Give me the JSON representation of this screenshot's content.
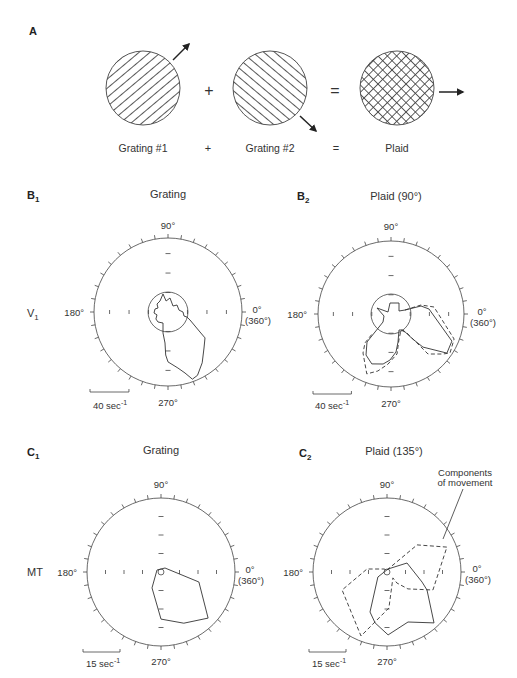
{
  "figure": {
    "panel_a": {
      "label": "A",
      "stimuli": [
        {
          "caption": "Grating #1",
          "pattern": "grating-oblique-rising",
          "motion_arrow": "arrow-up-right"
        },
        {
          "caption": "Grating #2",
          "pattern": "grating-oblique-falling",
          "motion_arrow": "arrow-down-right"
        },
        {
          "caption": "Plaid",
          "pattern": "plaid-crosshatch",
          "motion_arrow": "arrow-right"
        }
      ],
      "operators": {
        "plus": "+",
        "equals": "="
      }
    },
    "row_labels": {
      "v1": {
        "main": "V",
        "sub": "1"
      },
      "mt": "MT"
    }
  },
  "chart_data": [
    {
      "type": "polar",
      "panel": {
        "letter": "B",
        "sub": "1"
      },
      "title": "Grating",
      "angle_labels": {
        "top": "90°",
        "left": "180°",
        "right": "0°",
        "right_alt": "(360°)",
        "bottom": "270°"
      },
      "angle_tick_step_deg": 10,
      "rmax": 76,
      "radial_ticks": [
        20,
        40,
        60
      ],
      "spontaneous_rate": 20.5,
      "scale_bar": {
        "value": 40,
        "label": "40 sec",
        "unit_exp": "-1"
      },
      "series": [
        {
          "style": "solid",
          "closed": true,
          "points": [
            [
              105.5,
              19.2
            ],
            [
              100,
              11.5
            ],
            [
              82,
              14.5
            ],
            [
              50,
              8.0
            ],
            [
              38,
              11.7
            ],
            [
              10,
              11.5
            ],
            [
              0,
              15.4
            ],
            [
              346,
              16.9
            ],
            [
              345,
              20.2
            ],
            [
              340,
              24.0
            ],
            [
              328,
              38.7
            ],
            [
              325,
              46.4
            ],
            [
              315,
              52.3
            ],
            [
              304,
              62.9
            ],
            [
              295,
              71.7
            ],
            [
              290,
              73.4
            ],
            [
              285.6,
              65.0
            ],
            [
              280,
              58.4
            ],
            [
              270,
              51.3
            ],
            [
              267,
              44.2
            ],
            [
              264.5,
              32.0
            ],
            [
              256.6,
              22.2
            ],
            [
              245.6,
              12.4
            ],
            [
              225,
              14.5
            ],
            [
              210,
              14.3
            ],
            [
              195,
              11.7
            ],
            [
              184,
              14.4
            ],
            [
              167,
              13.7
            ],
            [
              158,
              11.1
            ],
            [
              144,
              14.0
            ],
            [
              126,
              14.0
            ]
          ]
        }
      ]
    },
    {
      "type": "polar",
      "panel": {
        "letter": "B",
        "sub": "2"
      },
      "title": "Plaid (90°)",
      "angle_labels": {
        "top": "90°",
        "left": "180°",
        "right": "0°",
        "right_alt": "(360°)",
        "bottom": "270°"
      },
      "angle_tick_step_deg": 10,
      "rmax": 76,
      "radial_ticks": [
        20,
        40,
        60
      ],
      "spontaneous_rate": 20.8,
      "scale_bar": {
        "value": 40,
        "label": "40 sec",
        "unit_exp": "-1"
      },
      "series": [
        {
          "style": "solid",
          "closed": true,
          "points": [
            [
              156.8,
              15.9
            ],
            [
              146,
              3.8
            ],
            [
              95,
              11.5
            ],
            [
              54,
              14.2
            ],
            [
              20.6,
              8.9
            ],
            [
              16,
              15.2
            ],
            [
              15,
              32.3
            ],
            [
              7.5,
              39.9
            ],
            [
              336,
              69.4
            ],
            [
              325,
              71.0
            ],
            [
              314,
              47.9
            ],
            [
              311,
              34.7
            ],
            [
              307,
              20.8
            ],
            [
              296.6,
              18.6
            ],
            [
              284,
              30.1
            ],
            [
              277.5,
              39.9
            ],
            [
              268.8,
              47.9
            ],
            [
              261,
              52.7
            ],
            [
              249,
              55.7
            ],
            [
              238.6,
              50.0
            ],
            [
              229.4,
              38.4
            ],
            [
              228.4,
              25.1
            ],
            [
              225,
              11.8
            ],
            [
              196,
              7.6
            ]
          ]
        },
        {
          "style": "dashed",
          "closed": false,
          "points": [
            [
              16,
              15.2
            ],
            [
              16.7,
              32.6
            ],
            [
              9.2,
              45.4
            ],
            [
              338.4,
              70.6
            ],
            [
              326.5,
              73.6
            ],
            [
              322.4,
              68.3
            ],
            [
              312.8,
              56.7
            ],
            [
              310,
              25.9
            ],
            [
              302,
              19.7
            ],
            [
              287,
              28.3
            ],
            [
              278.5,
              42.1
            ],
            [
              266.6,
              52.2
            ],
            [
              257,
              60.9
            ],
            [
              248,
              67.3
            ],
            [
              234.3,
              50.0
            ],
            [
              228,
              40.5
            ],
            [
              226.5,
              27.3
            ]
          ]
        }
      ]
    },
    {
      "type": "polar",
      "panel": {
        "letter": "C",
        "sub": "1"
      },
      "title": "Grating",
      "angle_labels": {
        "top": "90°",
        "left": "180°",
        "right": "0°",
        "right_alt": "(360°)",
        "bottom": "270°"
      },
      "angle_tick_step_deg": 10,
      "rmax": 30,
      "radial_ticks": [
        7.5,
        15,
        22.5
      ],
      "spontaneous_rate": 1.2,
      "scale_bar": {
        "value": 15,
        "label": "15 sec",
        "unit_exp": "-1"
      },
      "series": [
        {
          "style": "solid",
          "closed": true,
          "points": [
            [
              45,
              2.3
            ],
            [
              345.3,
              15.9
            ],
            [
              315.6,
              26.7
            ],
            [
              294,
              22.7
            ],
            [
              270,
              19.1
            ],
            [
              240.6,
              7.4
            ],
            [
              153,
              1.8
            ]
          ]
        }
      ]
    },
    {
      "type": "polar",
      "panel": {
        "letter": "C",
        "sub": "2"
      },
      "title": "Plaid (135°)",
      "angle_labels": {
        "top": "90°",
        "left": "180°",
        "right": "0°",
        "right_alt": "(360°)",
        "bottom": "270°"
      },
      "angle_tick_step_deg": 10,
      "rmax": 30,
      "radial_ticks": [
        7.5,
        15,
        22.5
      ],
      "spontaneous_rate": 1.2,
      "scale_bar": {
        "value": 15,
        "label": "15 sec",
        "unit_exp": "-1"
      },
      "annotation": {
        "line1": "Components",
        "line2": "of movement"
      },
      "series": [
        {
          "style": "solid",
          "closed": true,
          "points": [
            [
              71.6,
              1.3
            ],
            [
              24.2,
              8.9
            ],
            [
              344,
              14.8
            ],
            [
              335.8,
              17.8
            ],
            [
              312.7,
              28.1
            ],
            [
              292.8,
              22.0
            ],
            [
              271,
              25.5
            ],
            [
              256.8,
              21.2
            ],
            [
              247,
              17.6
            ],
            [
              209,
              4.2
            ]
          ]
        },
        {
          "style": "dashed",
          "closed": true,
          "points": [
            [
              90,
              0.8
            ],
            [
              42,
              16.4
            ],
            [
              22.6,
              26.3
            ],
            [
              338.6,
              20.0
            ],
            [
              321,
              10.9
            ],
            [
              312,
              6.0
            ],
            [
              315,
              3.4
            ],
            [
              273,
              14.6
            ],
            [
              247.9,
              28.0
            ],
            [
              201.8,
              19.6
            ],
            [
              171.5,
              8.2
            ],
            [
              135,
              1.7
            ]
          ]
        }
      ]
    }
  ]
}
